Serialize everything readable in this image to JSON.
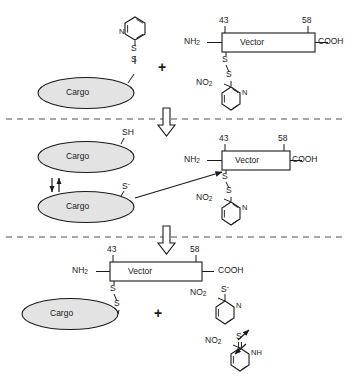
{
  "diagram": {
    "type": "reaction-scheme",
    "colors": {
      "stroke": "#1a1a1a",
      "cargo_fill": "#e3e3e3",
      "divider": "#8a8a8a",
      "background": "#ffffff"
    },
    "labels": {
      "cargo": "Cargo",
      "vector": "Vector",
      "n_terminus": "NH",
      "n_terminus_sub": "2",
      "c_terminus": "COOH",
      "residue_start": "43",
      "residue_end": "58",
      "sulfur": "S",
      "thiol": "SH",
      "thiolate": "S",
      "thiolate_charge": "-",
      "nitro": "NO",
      "nitro_sub": "2",
      "nitrogen": "N",
      "amine_nh": "NH",
      "plus": "+"
    }
  },
  "steps": [
    {
      "id": "step-1",
      "name": "reactants",
      "reactant_left": {
        "name": "cargo-pyridyl-disulfide",
        "cargo_label": "Cargo",
        "linker": [
          "S",
          "S"
        ],
        "ring": "pyridine",
        "ring_hetero": "N"
      },
      "operator": "+",
      "reactant_right": {
        "name": "vector-nitropyridyl-disulfide",
        "terminus_left": "NH2",
        "box_label": "Vector",
        "terminus_right": "COOH",
        "residue_start": "43",
        "residue_end": "58",
        "linker": [
          "S",
          "S"
        ],
        "ring": "nitropyridine",
        "ring_substituent": "NO2",
        "ring_hetero": "N"
      }
    },
    {
      "id": "step-2",
      "name": "thiol-thiolate-equilibrium-and-attack",
      "cargo_top": {
        "label": "Cargo",
        "group": "SH"
      },
      "cargo_bottom": {
        "label": "Cargo",
        "group": "S-"
      },
      "equilibrium": "double-arrow",
      "attack_arrow": "thiolate-attacks-disulfide",
      "vector": {
        "terminus_left": "NH2",
        "box_label": "Vector",
        "terminus_right": "COOH",
        "residue_start": "43",
        "residue_end": "58",
        "linker": [
          "S",
          "S"
        ],
        "ring_substituent": "NO2",
        "ring_hetero": "N"
      }
    },
    {
      "id": "step-3",
      "name": "products",
      "product_left": {
        "name": "cargo-vector-conjugate",
        "terminus_left": "NH2",
        "box_label": "Vector",
        "terminus_right": "COOH",
        "residue_start": "43",
        "residue_end": "58",
        "linker": [
          "S",
          "S"
        ],
        "cargo_label": "Cargo"
      },
      "operator": "+",
      "product_right": {
        "name": "nitrothiopyridone-tautomers",
        "tautomer_a": {
          "substituent": "NO2",
          "group": "S-",
          "hetero": "N"
        },
        "equilibrium": "double-arrow",
        "tautomer_b": {
          "substituent": "NO2",
          "group": "S",
          "hetero": "NH"
        }
      }
    }
  ],
  "dividers": [
    {
      "name": "divider-1",
      "y": 119,
      "style": "dashed"
    },
    {
      "name": "divider-2",
      "y": 237,
      "style": "dashed"
    }
  ],
  "flow_arrows": [
    {
      "name": "flow-arrow-1",
      "direction": "down"
    },
    {
      "name": "flow-arrow-2",
      "direction": "down"
    }
  ]
}
